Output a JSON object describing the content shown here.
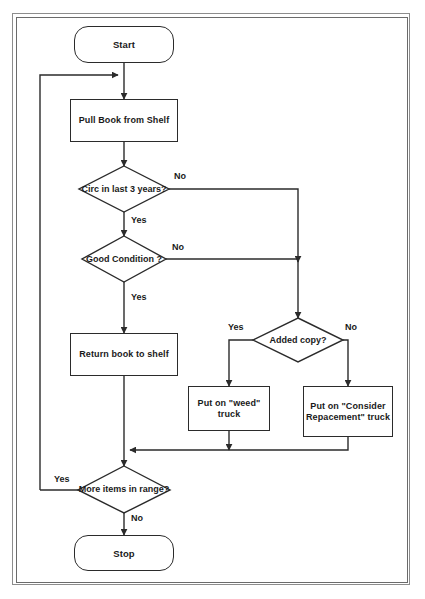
{
  "diagram": {
    "type": "flowchart",
    "stroke_color": "#2b2b2b",
    "background_color": "#ffffff",
    "frame_color": "#8d8d8d",
    "nodes": [
      {
        "id": "start",
        "shape": "terminator",
        "label": "Start"
      },
      {
        "id": "pull",
        "shape": "process",
        "label": "Pull Book from Shelf"
      },
      {
        "id": "circ",
        "shape": "decision",
        "label": "Circ in last 3 years?"
      },
      {
        "id": "condition",
        "shape": "decision",
        "label": "Good Condition ?"
      },
      {
        "id": "return",
        "shape": "process",
        "label": "Return book to shelf"
      },
      {
        "id": "added",
        "shape": "decision",
        "label": "Added copy?"
      },
      {
        "id": "weed",
        "shape": "process",
        "label": "Put on \"weed\" truck"
      },
      {
        "id": "consider",
        "shape": "process",
        "label": "Put on \"Consider Repacement\" truck"
      },
      {
        "id": "more",
        "shape": "decision",
        "label": "More items in range?"
      },
      {
        "id": "stop",
        "shape": "terminator",
        "label": "Stop"
      }
    ],
    "edge_labels": {
      "circ_no": "No",
      "circ_yes": "Yes",
      "condition_no": "No",
      "condition_yes": "Yes",
      "added_yes": "Yes",
      "added_no": "No",
      "more_yes": "Yes",
      "more_no": "No"
    }
  }
}
